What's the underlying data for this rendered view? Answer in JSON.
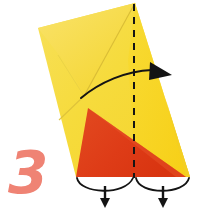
{
  "figure": {
    "kind": "origami-fold-instruction",
    "step_number": "3",
    "step_number_color": "#EF8374",
    "background_color": "#FFFFFF",
    "paper": {
      "front_color": "#F6DB3C",
      "front_shade_color": "#F8D618",
      "back_color": "#DE3C17",
      "back_shade_color": "#E8562A",
      "crease_line_color": "#CBAE2A"
    },
    "annotations": {
      "valley_fold_line_color": "#1A1A1A",
      "valley_fold_line_style": "dashed-vertical",
      "fold_arrow_color": "#1A1A1A",
      "fold_arrow_label": "fold-right-arrow",
      "pleat_arrow_count": "2",
      "pleat_arrow_label": "push-in-arrow"
    }
  }
}
